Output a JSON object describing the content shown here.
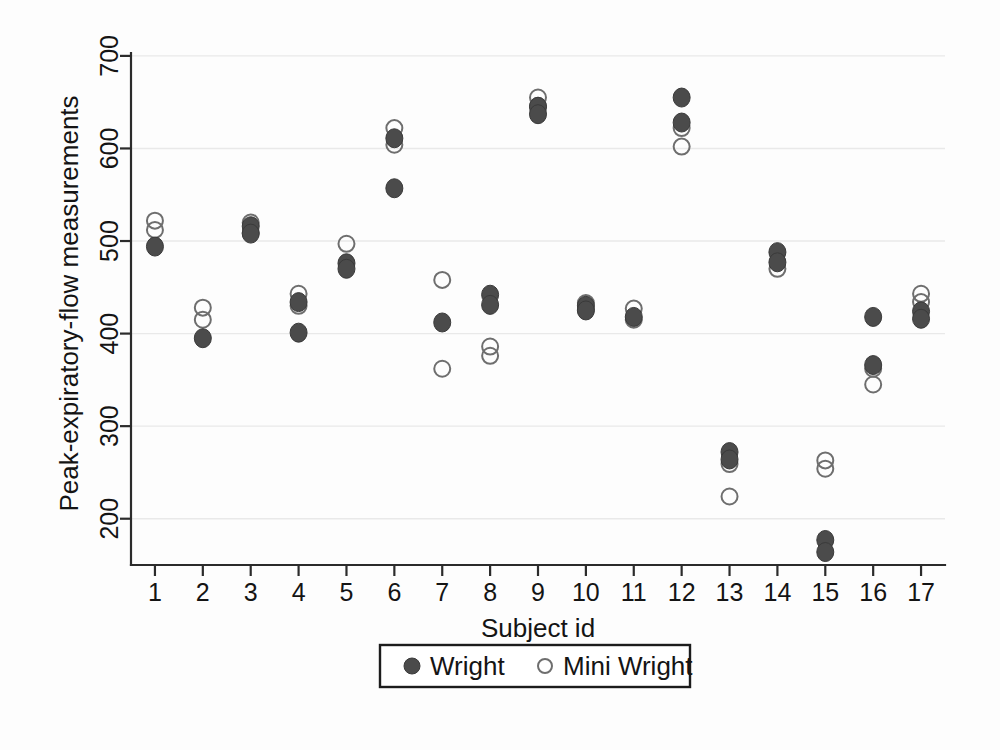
{
  "chart_data": {
    "type": "scatter",
    "title": "",
    "xlabel": "Subject id",
    "ylabel": "Peak-expiratory-flow measurements",
    "xlim": [
      0.5,
      17.5
    ],
    "ylim": [
      150,
      715
    ],
    "grid": true,
    "legend_position": "below-axes",
    "x_tick_labels": [
      "1",
      "2",
      "3",
      "4",
      "5",
      "6",
      "7",
      "8",
      "9",
      "10",
      "11",
      "12",
      "13",
      "14",
      "15",
      "16",
      "17"
    ],
    "y_tick_labels": [
      "200",
      "300",
      "400",
      "500",
      "600",
      "700"
    ],
    "y_ticks": [
      200,
      300,
      400,
      500,
      600,
      700
    ],
    "series": [
      {
        "name": "Wright",
        "marker": "filled-circle",
        "color": "#4b4b4b",
        "points": [
          {
            "x": 1,
            "y": 494
          },
          {
            "x": 2,
            "y": 395
          },
          {
            "x": 3,
            "y": 516
          },
          {
            "x": 3,
            "y": 508
          },
          {
            "x": 4,
            "y": 434
          },
          {
            "x": 4,
            "y": 401
          },
          {
            "x": 5,
            "y": 476
          },
          {
            "x": 5,
            "y": 470
          },
          {
            "x": 6,
            "y": 611
          },
          {
            "x": 6,
            "y": 557
          },
          {
            "x": 7,
            "y": 412
          },
          {
            "x": 8,
            "y": 442
          },
          {
            "x": 8,
            "y": 431
          },
          {
            "x": 9,
            "y": 645
          },
          {
            "x": 9,
            "y": 637
          },
          {
            "x": 10,
            "y": 430
          },
          {
            "x": 10,
            "y": 425
          },
          {
            "x": 11,
            "y": 418
          },
          {
            "x": 12,
            "y": 655
          },
          {
            "x": 12,
            "y": 628
          },
          {
            "x": 13,
            "y": 272
          },
          {
            "x": 13,
            "y": 264
          },
          {
            "x": 14,
            "y": 488
          },
          {
            "x": 14,
            "y": 477
          },
          {
            "x": 15,
            "y": 177
          },
          {
            "x": 15,
            "y": 164
          },
          {
            "x": 16,
            "y": 418
          },
          {
            "x": 16,
            "y": 366
          },
          {
            "x": 17,
            "y": 424
          },
          {
            "x": 17,
            "y": 416
          }
        ]
      },
      {
        "name": "Mini Wright",
        "marker": "open-circle",
        "color": "#6e6e6e",
        "points": [
          {
            "x": 1,
            "y": 522
          },
          {
            "x": 1,
            "y": 512
          },
          {
            "x": 2,
            "y": 428
          },
          {
            "x": 2,
            "y": 415
          },
          {
            "x": 3,
            "y": 520
          },
          {
            "x": 3,
            "y": 509
          },
          {
            "x": 4,
            "y": 443
          },
          {
            "x": 4,
            "y": 430
          },
          {
            "x": 5,
            "y": 497
          },
          {
            "x": 6,
            "y": 622
          },
          {
            "x": 6,
            "y": 604
          },
          {
            "x": 7,
            "y": 458
          },
          {
            "x": 7,
            "y": 362
          },
          {
            "x": 8,
            "y": 386
          },
          {
            "x": 8,
            "y": 376
          },
          {
            "x": 9,
            "y": 655
          },
          {
            "x": 9,
            "y": 646
          },
          {
            "x": 10,
            "y": 433
          },
          {
            "x": 10,
            "y": 426
          },
          {
            "x": 11,
            "y": 427
          },
          {
            "x": 11,
            "y": 415
          },
          {
            "x": 12,
            "y": 622
          },
          {
            "x": 12,
            "y": 602
          },
          {
            "x": 13,
            "y": 259
          },
          {
            "x": 13,
            "y": 224
          },
          {
            "x": 14,
            "y": 470
          },
          {
            "x": 15,
            "y": 263
          },
          {
            "x": 15,
            "y": 254
          },
          {
            "x": 16,
            "y": 362
          },
          {
            "x": 16,
            "y": 345
          },
          {
            "x": 17,
            "y": 443
          },
          {
            "x": 17,
            "y": 434
          }
        ]
      }
    ]
  },
  "legend": {
    "entries": [
      {
        "label": "Wright",
        "marker": "filled-circle"
      },
      {
        "label": "Mini Wright",
        "marker": "open-circle"
      }
    ]
  },
  "colors": {
    "filled_marker": "#4b4b4b",
    "open_marker": "#6e6e6e",
    "axis": "#2b2b2b",
    "grid": "#e9e9e9",
    "background": "#fdfdfd"
  }
}
